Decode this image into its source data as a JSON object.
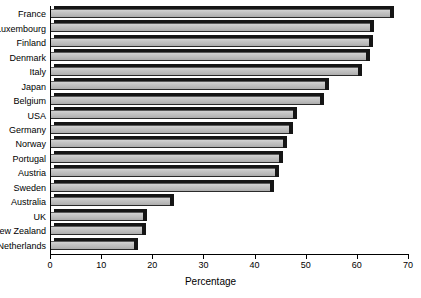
{
  "chart_data": {
    "type": "bar",
    "orientation": "horizontal",
    "title": "",
    "xlabel": "Percentage",
    "ylabel": "",
    "xlim": [
      0,
      70
    ],
    "ylim": null,
    "grid": false,
    "legend": null,
    "xticks": [
      0,
      10,
      20,
      30,
      40,
      50,
      60,
      70
    ],
    "xtick_labels": [
      "0",
      "10",
      "20",
      "30",
      "40",
      "50",
      "60",
      "70"
    ],
    "categories": [
      "France",
      "Luxembourg",
      "Finland",
      "Denmark",
      "Italy",
      "Japan",
      "Belgium",
      "USA",
      "Germany",
      "Norway",
      "Portugal",
      "Austria",
      "Sweden",
      "Australia",
      "UK",
      "New Zealand",
      "Netherlands"
    ],
    "values": [
      66.5,
      62.5,
      62.3,
      61.8,
      60.2,
      53.8,
      52.8,
      47.5,
      46.8,
      45.6,
      44.8,
      44.0,
      43.0,
      23.5,
      18.2,
      18.0,
      16.5
    ],
    "series": [
      {
        "name": "Percentage",
        "values": [
          66.5,
          62.5,
          62.3,
          61.8,
          60.2,
          53.8,
          52.8,
          47.5,
          46.8,
          45.6,
          44.8,
          44.0,
          43.0,
          23.5,
          18.2,
          18.0,
          16.5
        ]
      }
    ],
    "colors": {
      "bar_fill": "#c4c4c4",
      "bar_shadow": "#151515",
      "axis": "#000000",
      "text": "#000000",
      "background": "#ffffff"
    }
  }
}
